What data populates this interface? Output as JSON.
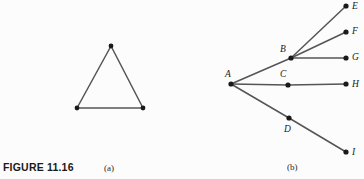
{
  "figure": {
    "number_label": "FIGURE 11.16",
    "background_color": "#fcfcfc",
    "ink_color": "#1a1a1a",
    "edge_color": "#555555",
    "width": 364,
    "height": 179
  },
  "panels": [
    {
      "id": "a",
      "caption": "(a)",
      "type": "triangle-graph",
      "vertices": [
        {
          "name": "apex",
          "x": 111,
          "y": 46
        },
        {
          "name": "bottom-left",
          "x": 77,
          "y": 108
        },
        {
          "name": "bottom-right",
          "x": 143,
          "y": 108
        }
      ],
      "edges": [
        {
          "from": "apex",
          "to": "bottom-left"
        },
        {
          "from": "apex",
          "to": "bottom-right"
        },
        {
          "from": "bottom-left",
          "to": "bottom-right"
        }
      ]
    },
    {
      "id": "b",
      "caption": "(b)",
      "type": "tree-graph",
      "nodes": [
        {
          "label": "A",
          "x": 231,
          "y": 84,
          "label_x": 225,
          "label_y": 77
        },
        {
          "label": "B",
          "x": 291,
          "y": 58,
          "label_x": 280,
          "label_y": 52
        },
        {
          "label": "C",
          "x": 288,
          "y": 85,
          "label_x": 280,
          "label_y": 77
        },
        {
          "label": "D",
          "x": 289,
          "y": 118,
          "label_x": 284,
          "label_y": 132
        },
        {
          "label": "E",
          "x": 346,
          "y": 6,
          "label_x": 352,
          "label_y": 9
        },
        {
          "label": "F",
          "x": 346,
          "y": 32,
          "label_x": 352,
          "label_y": 34
        },
        {
          "label": "G",
          "x": 346,
          "y": 58,
          "label_x": 352,
          "label_y": 60
        },
        {
          "label": "H",
          "x": 346,
          "y": 84,
          "label_x": 352,
          "label_y": 87
        },
        {
          "label": "I",
          "x": 346,
          "y": 152,
          "label_x": 352,
          "label_y": 155
        }
      ],
      "edges": [
        {
          "from": "A",
          "to": "B"
        },
        {
          "from": "A",
          "to": "C"
        },
        {
          "from": "A",
          "to": "D"
        },
        {
          "from": "B",
          "to": "E"
        },
        {
          "from": "B",
          "to": "F"
        },
        {
          "from": "B",
          "to": "G"
        },
        {
          "from": "C",
          "to": "H"
        },
        {
          "from": "D",
          "to": "I"
        }
      ]
    }
  ]
}
